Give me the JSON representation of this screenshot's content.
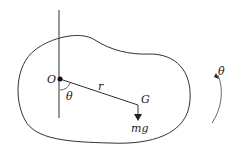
{
  "diagram": {
    "labels": {
      "pivot": "O",
      "radius": "r",
      "angle": "θ",
      "center_of_mass": "G",
      "weight": "mg",
      "angular_velocity": "θ̇"
    }
  }
}
